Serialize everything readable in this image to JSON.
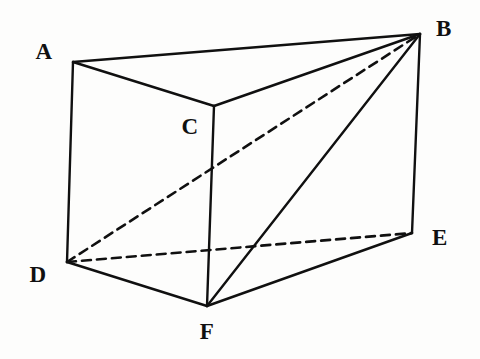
{
  "figure": {
    "name": "triangular-prism",
    "background_color": "#fdfdfc",
    "stroke_color": "#101010",
    "width": 480,
    "height": 359
  },
  "vertices": [
    {
      "id": "A",
      "label": "A",
      "x": 73,
      "y": 62,
      "label_x": 44,
      "label_y": 51
    },
    {
      "id": "B",
      "label": "B",
      "x": 420,
      "y": 34,
      "label_x": 444,
      "label_y": 28
    },
    {
      "id": "C",
      "label": "C",
      "x": 214,
      "y": 106,
      "label_x": 190,
      "label_y": 126
    },
    {
      "id": "D",
      "label": "D",
      "x": 67,
      "y": 262,
      "label_x": 38,
      "label_y": 274
    },
    {
      "id": "E",
      "label": "E",
      "x": 412,
      "y": 233,
      "label_x": 440,
      "label_y": 237
    },
    {
      "id": "F",
      "label": "F",
      "x": 207,
      "y": 306,
      "label_x": 207,
      "label_y": 331
    }
  ],
  "edges": [
    {
      "id": "AB",
      "from": "A",
      "to": "B",
      "style": "solid",
      "kind": "top-face-edge"
    },
    {
      "id": "AC",
      "from": "A",
      "to": "C",
      "style": "solid",
      "kind": "top-face-edge"
    },
    {
      "id": "CB",
      "from": "C",
      "to": "B",
      "style": "solid",
      "kind": "top-face-edge"
    },
    {
      "id": "AD",
      "from": "A",
      "to": "D",
      "style": "solid",
      "kind": "lateral-edge"
    },
    {
      "id": "CF",
      "from": "C",
      "to": "F",
      "style": "solid",
      "kind": "lateral-edge"
    },
    {
      "id": "BE",
      "from": "B",
      "to": "E",
      "style": "solid",
      "kind": "lateral-edge"
    },
    {
      "id": "DF",
      "from": "D",
      "to": "F",
      "style": "solid",
      "kind": "bottom-face-edge"
    },
    {
      "id": "FE",
      "from": "F",
      "to": "E",
      "style": "solid",
      "kind": "bottom-face-edge"
    },
    {
      "id": "DE",
      "from": "D",
      "to": "E",
      "style": "dashed",
      "kind": "bottom-face-hidden-edge"
    },
    {
      "id": "DB",
      "from": "D",
      "to": "B",
      "style": "dashed",
      "kind": "hidden-diagonal"
    },
    {
      "id": "FB",
      "from": "F",
      "to": "B",
      "style": "solid",
      "kind": "visible-diagonal"
    }
  ]
}
